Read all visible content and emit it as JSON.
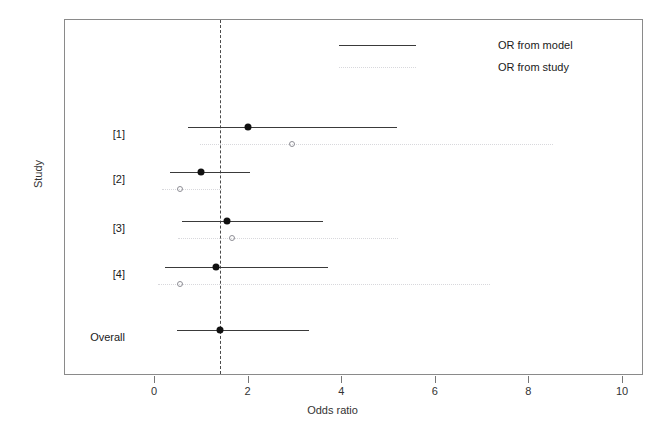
{
  "chart_data": {
    "type": "forest",
    "title": "",
    "xlabel": "Odds ratio",
    "ylabel": "Study",
    "xlim": [
      -1.4,
      10.45
    ],
    "xticks": [
      0,
      2,
      4,
      6,
      8,
      10
    ],
    "xtick_labels": [
      "0",
      "2",
      "4",
      "6",
      "8",
      "10"
    ],
    "grid": false,
    "reference_line": 1.41,
    "legend": {
      "position": "top-right",
      "entries": [
        {
          "key": "model",
          "label": "OR from model",
          "style": "solid"
        },
        {
          "key": "study",
          "label": "OR from study",
          "style": "dotted"
        }
      ]
    },
    "rows": [
      {
        "label": "[1]",
        "model_or": 2.01,
        "model_ci_low": 0.73,
        "model_ci_high": 5.19,
        "study_or": 2.95,
        "study_ci_low": 0.98,
        "study_ci_high": 8.53
      },
      {
        "label": "[2]",
        "model_or": 1.0,
        "model_ci_low": 0.34,
        "model_ci_high": 2.05,
        "study_or": 0.56,
        "study_ci_low": 0.17,
        "study_ci_high": 1.45
      },
      {
        "label": "[3]",
        "model_or": 1.56,
        "model_ci_low": 0.6,
        "model_ci_high": 3.61,
        "study_or": 1.67,
        "study_ci_low": 0.51,
        "study_ci_high": 5.21
      },
      {
        "label": "[4]",
        "model_or": 1.32,
        "model_ci_low": 0.24,
        "model_ci_high": 3.72,
        "study_or": 0.56,
        "study_ci_low": 0.09,
        "study_ci_high": 7.18
      },
      {
        "label": "Overall",
        "model_or": 1.41,
        "model_ci_low": 0.49,
        "model_ci_high": 3.31,
        "study_or": null,
        "study_ci_low": null,
        "study_ci_high": null
      }
    ]
  },
  "axis": {
    "x_title": "Odds ratio",
    "y_title": "Study"
  }
}
